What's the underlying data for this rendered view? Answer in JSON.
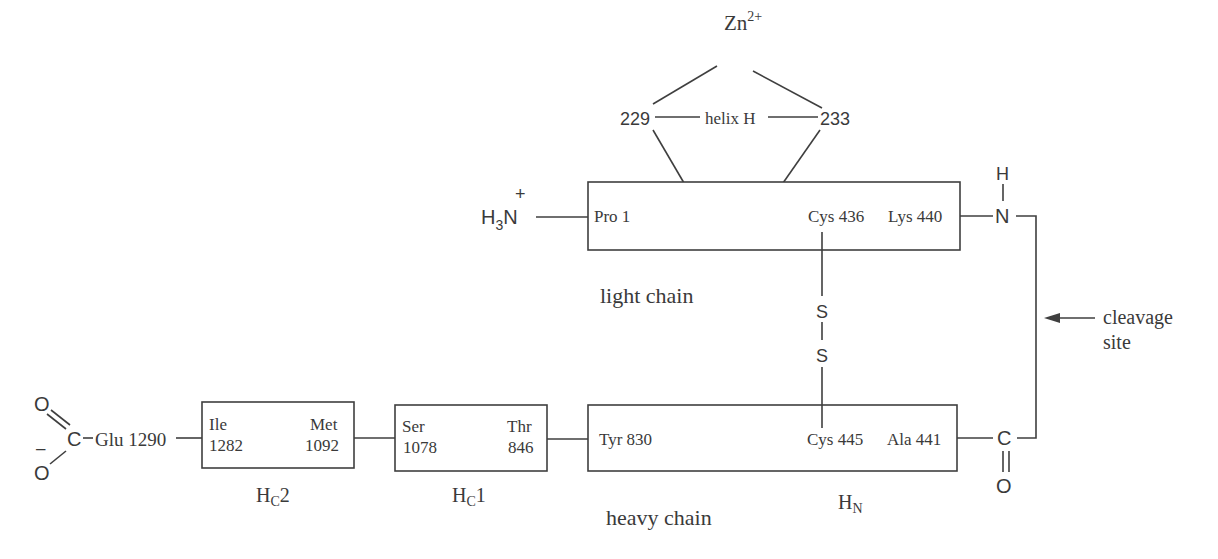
{
  "figure": {
    "type": "protein-domain-schematic",
    "zinc": {
      "label": "Zn",
      "charge": "2+"
    },
    "helix": {
      "label": "helix H",
      "left_residue": "229",
      "right_residue": "233"
    },
    "n_terminus": {
      "h": "H",
      "sub": "3",
      "n": "N",
      "charge": "+"
    },
    "light_chain": {
      "label": "light chain",
      "start": "Pro 1",
      "cys": "Cys 436",
      "end": "Lys 440"
    },
    "amide_nitrogen": {
      "h": "H",
      "n": "N"
    },
    "disulfide": {
      "s1": "S",
      "s2": "S"
    },
    "cleavage": {
      "line1": "cleavage",
      "line2": "site"
    },
    "heavy_chain": {
      "label": "heavy chain",
      "hn": {
        "label_main": "H",
        "label_sub": "N",
        "start": "Tyr 830",
        "cys": "Cys 445",
        "end": "Ala 441"
      },
      "hc1": {
        "label_main": "H",
        "label_sub": "C",
        "label_suffix": "1",
        "left_top": "Ser",
        "left_bottom": "1078",
        "right_top": "Thr",
        "right_bottom": "846"
      },
      "hc2": {
        "label_main": "H",
        "label_sub": "C",
        "label_suffix": "2",
        "left_top": "Ile",
        "left_bottom": "1282",
        "right_top": "Met",
        "right_bottom": "1092"
      }
    },
    "carbonyl": {
      "c": "C",
      "o": "O"
    },
    "c_terminus": {
      "residue": "Glu 1290",
      "c": "C",
      "o_double": "O",
      "o_single": "O",
      "charge": "–"
    }
  }
}
